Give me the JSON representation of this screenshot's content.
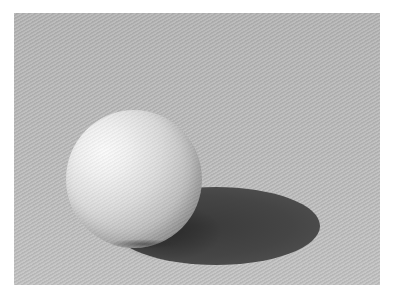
{
  "image": {
    "subject": "Shaded white sphere casting a shadow on textured gray paper",
    "colors": {
      "page_background": "#ffffff",
      "paper": "#b9b9b9",
      "sphere_highlight": "#fbfbfb",
      "sphere_core_shadow": "#9f9f9f",
      "cast_shadow": "#3a3a3a"
    },
    "elements": {
      "paper_region": {
        "x": 14,
        "y": 13,
        "width": 366,
        "height": 272
      },
      "sphere": {
        "center_x": 134,
        "center_y": 179,
        "radius": 68
      },
      "cast_shadow": {
        "center_x": 216,
        "center_y": 226,
        "rx": 104,
        "ry": 39
      }
    }
  }
}
